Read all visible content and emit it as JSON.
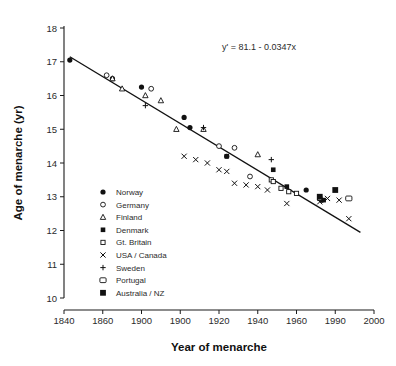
{
  "chart_data": {
    "type": "scatter",
    "title": "",
    "xlabel": "Year of menarche",
    "ylabel": "Age of menarche (yr)",
    "xlim": [
      1840,
      2000
    ],
    "ylim": [
      10,
      18
    ],
    "grid": false,
    "legend_position": "inside-left",
    "annotation": "y' = 81.1 - 0.0347x",
    "trendline": {
      "equation": "y' = 81.1 - 0.0347x",
      "intercept": 81.1,
      "slope": -0.0347,
      "x_start": 1843,
      "x_end": 1993
    },
    "xticks": [
      1840,
      1860,
      1900,
      1900,
      1920,
      1940,
      1960,
      1990,
      2000
    ],
    "xtick_labels": [
      "1840",
      "1860",
      "1900",
      "1900",
      "1920",
      "1940",
      "1960",
      "1990",
      "2000"
    ],
    "xtick_values": [
      1840,
      1860,
      1880,
      1900,
      1920,
      1940,
      1960,
      1980,
      2000
    ],
    "yticks": [
      10,
      11,
      12,
      13,
      14,
      15,
      16,
      17,
      18
    ],
    "ytick_labels": [
      "10",
      "11",
      "12",
      "13",
      "14",
      "15",
      "16",
      "17",
      "18"
    ],
    "series": [
      {
        "name": "Norway",
        "marker": "filled-circle",
        "points": [
          [
            1843,
            17.05
          ],
          [
            1865,
            16.5
          ],
          [
            1880,
            16.25
          ],
          [
            1902,
            15.35
          ],
          [
            1905,
            15.05
          ],
          [
            1924,
            14.2
          ],
          [
            1965,
            13.2
          ],
          [
            1973,
            12.9
          ]
        ]
      },
      {
        "name": "Germany",
        "marker": "open-circle",
        "points": [
          [
            1862,
            16.6
          ],
          [
            1885,
            16.2
          ],
          [
            1920,
            14.5
          ],
          [
            1928,
            14.45
          ],
          [
            1936,
            13.6
          ]
        ]
      },
      {
        "name": "Finland",
        "marker": "open-triangle",
        "points": [
          [
            1865,
            16.5
          ],
          [
            1870,
            16.2
          ],
          [
            1882,
            16.0
          ],
          [
            1890,
            15.85
          ],
          [
            1898,
            15.0
          ],
          [
            1912,
            15.0
          ],
          [
            1940,
            14.25
          ]
        ]
      },
      {
        "name": "Denmark",
        "marker": "filled-square",
        "points": [
          [
            1924,
            14.2
          ],
          [
            1948,
            13.8
          ],
          [
            1955,
            13.3
          ],
          [
            1974,
            12.9
          ]
        ]
      },
      {
        "name": "Gt. Britain",
        "marker": "open-square-small",
        "points": [
          [
            1947,
            13.5
          ],
          [
            1948,
            13.45
          ],
          [
            1952,
            13.25
          ],
          [
            1956,
            13.15
          ],
          [
            1960,
            13.1
          ],
          [
            1972,
            12.95
          ]
        ]
      },
      {
        "name": "USA / Canada",
        "marker": "cross-x",
        "points": [
          [
            1902,
            14.2
          ],
          [
            1908,
            14.1
          ],
          [
            1914,
            14.0
          ],
          [
            1920,
            13.8
          ],
          [
            1924,
            13.75
          ],
          [
            1928,
            13.4
          ],
          [
            1934,
            13.35
          ],
          [
            1940,
            13.3
          ],
          [
            1945,
            13.2
          ],
          [
            1955,
            12.8
          ],
          [
            1972,
            12.85
          ],
          [
            1976,
            12.95
          ],
          [
            1982,
            12.9
          ],
          [
            1987,
            12.35
          ]
        ]
      },
      {
        "name": "Sweden",
        "marker": "plus",
        "points": [
          [
            1882,
            15.7
          ],
          [
            1912,
            15.05
          ],
          [
            1947,
            14.1
          ]
        ]
      },
      {
        "name": "Portugal",
        "marker": "open-square",
        "points": [
          [
            1987,
            12.95
          ]
        ]
      },
      {
        "name": "Australia / NZ",
        "marker": "filled-square-large",
        "points": [
          [
            1972,
            13.0
          ],
          [
            1980,
            13.2
          ]
        ]
      }
    ]
  },
  "legend": {
    "items": [
      {
        "label": "Norway",
        "marker": "filled-circle"
      },
      {
        "label": "Germany",
        "marker": "open-circle"
      },
      {
        "label": "Finland",
        "marker": "open-triangle"
      },
      {
        "label": "Denmark",
        "marker": "filled-square"
      },
      {
        "label": "Gt. Britain",
        "marker": "open-square-small"
      },
      {
        "label": "USA / Canada",
        "marker": "cross-x"
      },
      {
        "label": "Sweden",
        "marker": "plus"
      },
      {
        "label": "Portugal",
        "marker": "open-square"
      },
      {
        "label": "Australia / NZ",
        "marker": "filled-square-large"
      }
    ]
  },
  "colors": {
    "ink": "#111111",
    "text": "#2b2b2b",
    "background": "#ffffff"
  }
}
